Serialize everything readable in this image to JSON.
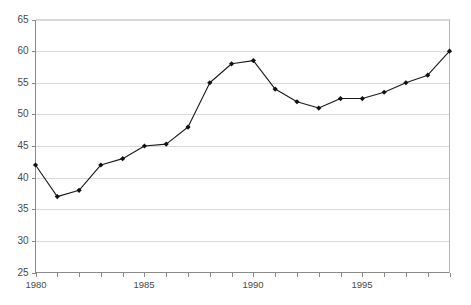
{
  "chart_data": {
    "type": "line",
    "title": "",
    "subtitle": "",
    "xlabel": "",
    "ylabel": "",
    "grid": "horizontal",
    "legend": "none",
    "xlim": [
      1980,
      1999
    ],
    "ylim": [
      25,
      65
    ],
    "y_ticks": [
      25,
      30,
      35,
      40,
      45,
      50,
      55,
      60,
      65
    ],
    "y_tick_labels": [
      "25",
      "30",
      "35",
      "40",
      "45",
      "50",
      "55",
      "60",
      "65"
    ],
    "x_tick_labels": [
      "1980",
      "1985",
      "1990",
      "1995"
    ],
    "x_tick_label_values": [
      1980,
      1985,
      1990,
      1995
    ],
    "x_minor_ticks": [
      1980,
      1981,
      1982,
      1983,
      1984,
      1985,
      1986,
      1987,
      1988,
      1989,
      1990,
      1991,
      1992,
      1993,
      1994,
      1995,
      1996,
      1997,
      1998,
      1999
    ],
    "x": [
      1980,
      1981,
      1982,
      1983,
      1984,
      1985,
      1986,
      1987,
      1988,
      1989,
      1990,
      1991,
      1992,
      1993,
      1994,
      1995,
      1996,
      1997,
      1998,
      1999
    ],
    "categories": [
      "1980",
      "1981",
      "1982",
      "1983",
      "1984",
      "1985",
      "1986",
      "1987",
      "1988",
      "1989",
      "1990",
      "1991",
      "1992",
      "1993",
      "1994",
      "1995",
      "1996",
      "1997",
      "1998",
      "1999"
    ],
    "values": [
      42,
      37,
      38,
      42,
      43,
      45,
      45.3,
      48,
      55,
      58,
      58.5,
      54,
      52,
      51,
      52.5,
      52.5,
      53.5,
      55,
      56.2,
      60
    ],
    "series": [
      {
        "name": "series-1",
        "marker": "diamond",
        "line_color": "#1a1a1a",
        "marker_color": "#111111",
        "values": [
          42,
          37,
          38,
          42,
          43,
          45,
          45.3,
          48,
          55,
          58,
          58.5,
          54,
          52,
          51,
          52.5,
          52.5,
          53.5,
          55,
          56.2,
          60
        ]
      }
    ],
    "colors": {
      "line": "#1a1a1a",
      "marker": "#111111",
      "grid": "#d9d9d9",
      "axis": "#8a8a8a",
      "frame": "#b5b5b5",
      "tick_label": "#4a4a4a",
      "background": "#ffffff"
    }
  }
}
